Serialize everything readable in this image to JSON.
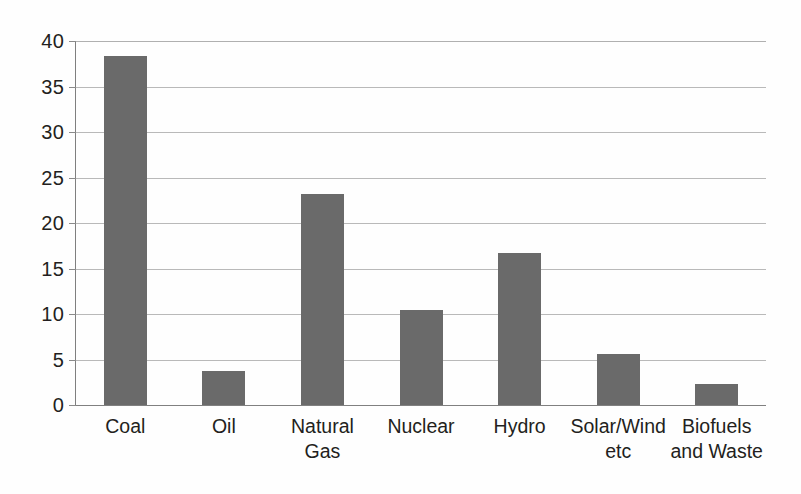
{
  "chart_data": {
    "type": "bar",
    "title": "",
    "subtitle": "",
    "xlabel": "",
    "ylabel": "",
    "categories": [
      "Coal",
      "Oil",
      "Natural Gas",
      "Nuclear",
      "Hydro",
      "Solar/Wind etc",
      "Biofuels and Waste"
    ],
    "category_lines": [
      [
        "Coal"
      ],
      [
        "Oil"
      ],
      [
        "Natural",
        "Gas"
      ],
      [
        "Nuclear"
      ],
      [
        "Hydro"
      ],
      [
        "Solar/Wind",
        "etc"
      ],
      [
        "Biofuels",
        "and Waste"
      ]
    ],
    "values": [
      38.3,
      3.7,
      23.2,
      10.4,
      16.7,
      5.6,
      2.3
    ],
    "ylim": [
      0,
      40
    ],
    "yticks": [
      0,
      5,
      10,
      15,
      20,
      25,
      30,
      35,
      40
    ],
    "ytick_labels": [
      "0",
      "5",
      "10",
      "15",
      "20",
      "25",
      "30",
      "35",
      "40"
    ],
    "grid": true,
    "grid_axis": "y",
    "legend": false,
    "legend_position": "none",
    "bar_color": "#6a6a6a",
    "gridline_color": "#b9b9b9",
    "axis_color": "#7f7f7f",
    "background_color": "#ffffff"
  }
}
